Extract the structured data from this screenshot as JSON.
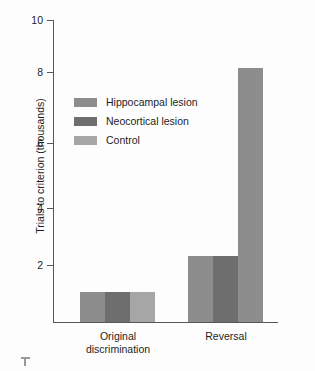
{
  "chart_data": {
    "type": "bar",
    "title": "",
    "xlabel": "",
    "ylabel": "Trials to criterion (thousands)",
    "categories": [
      "Original\ndiscrimination",
      "Reversal"
    ],
    "category_labels": [
      "Original\ndiscrimination",
      "Reversal"
    ],
    "ylim": [
      0,
      10
    ],
    "yticks": [
      10,
      8,
      6,
      4,
      2
    ],
    "ytick_labels": [
      "10",
      "8",
      "6",
      "4",
      "2"
    ],
    "grid": false,
    "legend_position": "upper-left-inside",
    "series": [
      {
        "name": "Hippocampal lesion",
        "color": "#8d8d8d",
        "values": [
          1.0,
          2.2
        ]
      },
      {
        "name": "Neocortical lesion",
        "color": "#6e6e6e",
        "values": [
          1.0,
          2.2
        ]
      },
      {
        "name": "Control",
        "color": "#a6a6a6",
        "values": [
          1.0,
          8.4
        ]
      }
    ]
  },
  "axis": {
    "y_title": "Trials to criterion (thousands)",
    "ticks": [
      {
        "label": "10",
        "value": 10
      },
      {
        "label": "8",
        "value": 8
      },
      {
        "label": "6",
        "value": 6
      },
      {
        "label": "4",
        "value": 4
      },
      {
        "label": "2",
        "value": 2
      }
    ]
  },
  "groups": [
    {
      "label": "Original\ndiscrimination"
    },
    {
      "label": "Reversal"
    }
  ],
  "legend": {
    "items": [
      {
        "label": "Hippocampal lesion",
        "color": "#8d8d8d"
      },
      {
        "label": "Neocortical lesion",
        "color": "#6e6e6e"
      },
      {
        "label": "Control",
        "color": "#a6a6a6"
      }
    ]
  },
  "colors": {
    "axis": "#58585a",
    "text": "#1d1d1d",
    "background": "#fdfdfd"
  }
}
